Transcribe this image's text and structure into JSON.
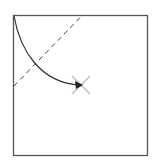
{
  "diagram": {
    "width": 155,
    "height": 164,
    "frame": {
      "x": 13.5,
      "y": 15.5,
      "w": 134,
      "h": 140,
      "stroke": "#555555",
      "stroke_width": 1.3
    },
    "dashed_line": {
      "x1": 14,
      "y1": 86,
      "x2": 82,
      "y2": 15.5,
      "stroke": "#444444",
      "dash": "5,4",
      "stroke_width": 1
    },
    "curve": {
      "path": "M14 16 C 20 50, 40 83, 80 85",
      "stroke": "#333333",
      "stroke_width": 1.2
    },
    "arrowhead": {
      "points": "83,85 75,81 76,89",
      "fill": "#222222"
    },
    "x_marker": {
      "cx": 81,
      "cy": 85,
      "size": 9,
      "stroke": "#bbbbbb",
      "stroke_width": 1.3
    }
  }
}
